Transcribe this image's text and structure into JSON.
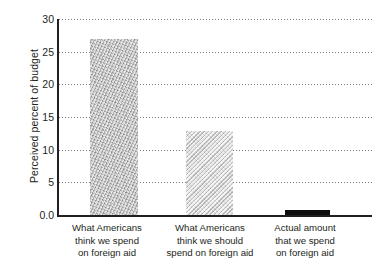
{
  "chart_data": {
    "type": "bar",
    "title": "",
    "subtitle": "",
    "xlabel": "",
    "ylabel": "Perceived percent of budget",
    "ylim": [
      0,
      30
    ],
    "yticks": [
      "0.0",
      "5",
      "10",
      "15",
      "20",
      "25",
      "30"
    ],
    "ytick_values": [
      0,
      5,
      10,
      15,
      20,
      25,
      30
    ],
    "grid": true,
    "legend": "none",
    "categories": [
      "What Americans think we spend on foreign aid",
      "What Americans think we should spend on foreign aid",
      "Actual amount that we spend on foreign aid"
    ],
    "category_lines": [
      [
        "What Americans",
        "think we spend",
        "on foreign aid"
      ],
      [
        "What Americans",
        "think we should",
        "spend on foreign aid"
      ],
      [
        "Actual amount",
        "that we spend",
        "on foreign aid"
      ]
    ],
    "values": [
      27.0,
      12.8,
      0.7
    ],
    "bar_styles": [
      "mottled-gray",
      "hatched-light-gray",
      "solid-black"
    ],
    "colors": {
      "bar1": "#b2b2b2",
      "bar2": "#cdcdcd",
      "bar3": "#0d0d0d",
      "axis": "#231f20",
      "grid": "#7b7b7b",
      "text": "#231f20",
      "background": "#ffffff"
    }
  }
}
